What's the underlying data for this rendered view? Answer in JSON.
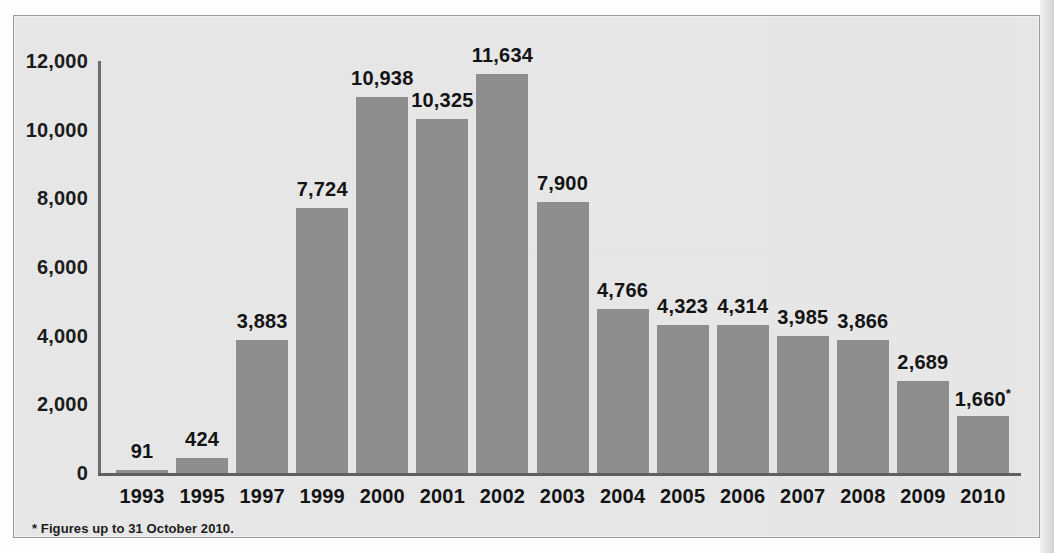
{
  "chart_data": {
    "type": "bar",
    "title": "",
    "xlabel": "",
    "ylabel": "",
    "categories": [
      "1993",
      "1995",
      "1997",
      "1999",
      "2000",
      "2001",
      "2002",
      "2003",
      "2004",
      "2005",
      "2006",
      "2007",
      "2008",
      "2009",
      "2010"
    ],
    "values": [
      91,
      424,
      3883,
      7724,
      10938,
      10325,
      11634,
      7900,
      4766,
      4323,
      4314,
      3985,
      3866,
      2689,
      1660
    ],
    "value_labels": [
      "91",
      "424",
      "3,883",
      "7,724",
      "10,938",
      "10,325",
      "11,634",
      "7,900",
      "4,766",
      "4,323",
      "4,314",
      "3,985",
      "3,866",
      "2,689",
      "1,660"
    ],
    "value_label_markers": [
      "",
      "",
      "",
      "",
      "",
      "",
      "",
      "",
      "",
      "",
      "",
      "",
      "",
      "",
      "*"
    ],
    "ylim": [
      0,
      12000
    ],
    "ytick_values": [
      0,
      2000,
      4000,
      6000,
      8000,
      10000,
      12000
    ],
    "ytick_labels": [
      "0",
      "2,000",
      "4,000",
      "6,000",
      "8,000",
      "10,000",
      "12,000"
    ],
    "grid": false,
    "legend": null,
    "footnote": "* Figures up to 31 October 2010.",
    "colors": {
      "bar_fill": "#8e8e8e",
      "panel_background": "#e9e9e9",
      "panel_border": "#9a9a9a",
      "axis_line": "#6d6d6d",
      "text": "#141414"
    }
  }
}
